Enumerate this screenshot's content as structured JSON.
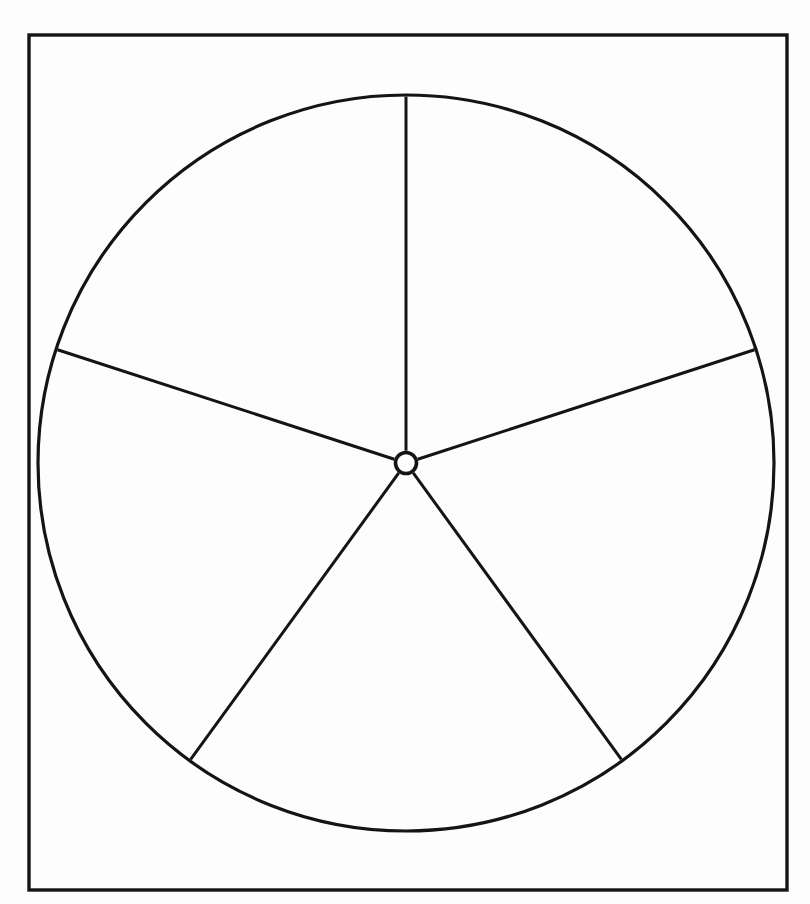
{
  "document": {
    "title": "Five-Spoke Wheel Diagram",
    "kind": "line-drawing",
    "background_color": "#fdfdfd",
    "ink_color": "#141414",
    "fill_color": "#ffffff",
    "width": 810,
    "height": 904
  },
  "frame": {
    "name": "outer-border-rectangle",
    "x": 29,
    "y": 35,
    "width": 758,
    "height": 855,
    "stroke_width": 3.4,
    "stroke_color": "#141414",
    "fill": "none"
  },
  "wheel": {
    "rim": {
      "name": "wheel-rim-circle",
      "center_x": 406,
      "center_y": 463,
      "radius": 368,
      "stroke_width": 3.2,
      "stroke_color": "#141414",
      "fill": "none"
    },
    "hub": {
      "name": "wheel-hub-circle",
      "center_x": 406,
      "center_y": 463,
      "radius": 10.5,
      "stroke_width": 3.6,
      "stroke_color": "#141414",
      "fill": "#ffffff"
    },
    "spoke_count": 5,
    "spoke_angle_step_degrees": 72,
    "spoke_stroke_width": 3.0,
    "spokes": [
      {
        "name": "spoke-north",
        "label": "N",
        "angle_degrees": 0,
        "inner_x": 406,
        "inner_y": 452.5,
        "outer_x": 406,
        "outer_y": 89
      },
      {
        "name": "spoke-northeast",
        "label": "NE",
        "angle_degrees": 72,
        "inner_x": 416,
        "inner_y": 459.8,
        "outer_x": 756,
        "outer_y": 349.3
      },
      {
        "name": "spoke-southeast",
        "label": "SE",
        "angle_degrees": 144,
        "inner_x": 412.2,
        "inner_y": 471.5,
        "outer_x": 622.3,
        "outer_y": 760.7
      },
      {
        "name": "spoke-southwest",
        "label": "SW",
        "angle_degrees": 216,
        "inner_x": 399.8,
        "inner_y": 471.5,
        "outer_x": 189.7,
        "outer_y": 760.7
      },
      {
        "name": "spoke-northwest",
        "label": "NW",
        "angle_degrees": 288,
        "inner_x": 396,
        "inner_y": 459.8,
        "outer_x": 56,
        "outer_y": 349.3
      }
    ],
    "sectors": [
      {
        "name": "sector-top-right",
        "from_degrees": 0,
        "to_degrees": 72
      },
      {
        "name": "sector-right",
        "from_degrees": 72,
        "to_degrees": 144
      },
      {
        "name": "sector-bottom",
        "from_degrees": 144,
        "to_degrees": 216
      },
      {
        "name": "sector-left",
        "from_degrees": 216,
        "to_degrees": 288
      },
      {
        "name": "sector-top-left",
        "from_degrees": 288,
        "to_degrees": 360
      }
    ]
  }
}
